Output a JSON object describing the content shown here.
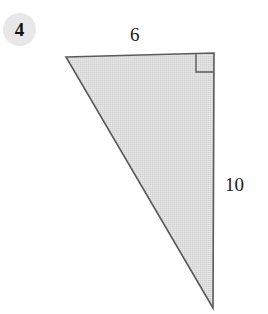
{
  "figure": {
    "problem_number": "4",
    "background_color": "#ffffff",
    "badge": {
      "label": "4",
      "fill_color": "#e8e8e8",
      "text_color": "#141414",
      "cx": 19.5,
      "cy": 29.5,
      "r": 16.5
    },
    "shape": {
      "name": "right-triangle",
      "fill_color": "#dcdcdc",
      "stroke_color": "#5a5a5a",
      "stroke_width": 1.6,
      "vertices": [
        {
          "name": "top-left",
          "x": 66,
          "y": 57
        },
        {
          "name": "top-right",
          "x": 214,
          "y": 53
        },
        {
          "name": "bottom-right",
          "x": 213,
          "y": 308
        }
      ]
    },
    "right_angle_marker": {
      "name": "right-angle-square",
      "at_vertex": "top-right",
      "size": 18,
      "stroke_color": "#5a5a5a",
      "stroke_width": 1.4,
      "points": [
        {
          "x": 196,
          "y": 54
        },
        {
          "x": 196,
          "y": 72
        },
        {
          "x": 214,
          "y": 72
        }
      ]
    },
    "labels": [
      {
        "name": "side-label-top",
        "text": "6",
        "side": "top",
        "x": 138,
        "y": 37
      },
      {
        "name": "side-label-right",
        "text": "10",
        "side": "right",
        "x": 237,
        "y": 185
      }
    ]
  }
}
